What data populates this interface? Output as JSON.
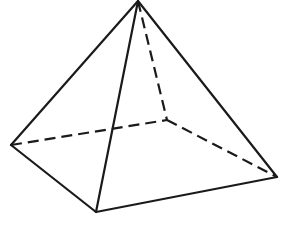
{
  "figure": {
    "name": "square-pyramid",
    "background_color": "#ffffff",
    "stroke_color": "#1a1a1a",
    "face_color": "#ffffff",
    "visible_stroke_width": 2.2,
    "hidden_stroke_width": 2.2,
    "hidden_dash_pattern": "11 6",
    "canvas": {
      "width": 282,
      "height": 226
    },
    "vertices": {
      "apex": {
        "label": "apex",
        "x": 138,
        "y": 1
      },
      "base_left": {
        "label": "base-left",
        "x": 11,
        "y": 145
      },
      "base_front": {
        "label": "base-front",
        "x": 96,
        "y": 212
      },
      "base_right": {
        "label": "base-right",
        "x": 277,
        "y": 177
      },
      "base_back": {
        "label": "base-back-hidden",
        "x": 167,
        "y": 120
      }
    },
    "edges": [
      {
        "name": "apex-to-base-left",
        "from": "apex",
        "to": "base_left",
        "style": "solid"
      },
      {
        "name": "apex-to-base-front",
        "from": "apex",
        "to": "base_front",
        "style": "solid"
      },
      {
        "name": "apex-to-base-right",
        "from": "apex",
        "to": "base_right",
        "style": "solid"
      },
      {
        "name": "apex-to-base-back",
        "from": "apex",
        "to": "base_back",
        "style": "dashed"
      },
      {
        "name": "base-left-to-base-front",
        "from": "base_left",
        "to": "base_front",
        "style": "solid"
      },
      {
        "name": "base-front-to-base-right",
        "from": "base_front",
        "to": "base_right",
        "style": "solid"
      },
      {
        "name": "base-left-to-base-back",
        "from": "base_left",
        "to": "base_back",
        "style": "dashed"
      },
      {
        "name": "base-back-to-base-right",
        "from": "base_back",
        "to": "base_right",
        "style": "dashed"
      }
    ],
    "faces": [
      {
        "name": "face-left-front",
        "vertices": [
          "apex",
          "base_left",
          "base_front"
        ],
        "visible": true
      },
      {
        "name": "face-front-right",
        "vertices": [
          "apex",
          "base_front",
          "base_right"
        ],
        "visible": true
      }
    ],
    "labels": []
  }
}
